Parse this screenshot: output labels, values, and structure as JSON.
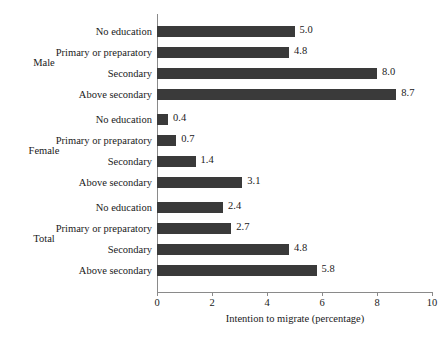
{
  "chart_data": {
    "type": "bar",
    "orientation": "horizontal",
    "title": "",
    "xlabel": "Intention to migrate (percentage)",
    "ylabel": "",
    "xlim": [
      0,
      10
    ],
    "xticks": [
      0,
      2,
      4,
      6,
      8,
      10
    ],
    "xtick_labels": [
      "0",
      "2",
      "4",
      "6",
      "8",
      "10"
    ],
    "grid": false,
    "legend": false,
    "bar_color": "#3a3a3a",
    "axis_color": "#8a8a8a",
    "groups": [
      {
        "label": "Male",
        "categories": [
          "No education",
          "Primary or preparatory",
          "Secondary",
          "Above secondary"
        ],
        "values": [
          5.0,
          4.8,
          8.0,
          8.7
        ],
        "value_labels": [
          "5.0",
          "4.8",
          "8.0",
          "8.7"
        ]
      },
      {
        "label": "Female",
        "categories": [
          "No education",
          "Primary or preparatory",
          "Secondary",
          "Above secondary"
        ],
        "values": [
          0.4,
          0.7,
          1.4,
          3.1
        ],
        "value_labels": [
          "0.4",
          "0.7",
          "1.4",
          "3.1"
        ]
      },
      {
        "label": "Total",
        "categories": [
          "No education",
          "Primary or preparatory",
          "Secondary",
          "Above secondary"
        ],
        "values": [
          2.4,
          2.7,
          4.8,
          5.8
        ],
        "value_labels": [
          "2.4",
          "2.7",
          "4.8",
          "5.8"
        ]
      }
    ]
  }
}
